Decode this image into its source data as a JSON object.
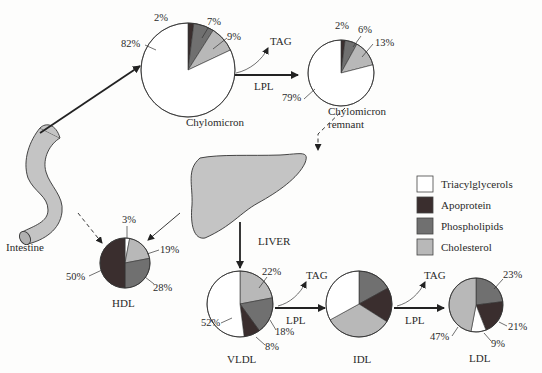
{
  "colors": {
    "triacylglycerols": "#ffffff",
    "apoprotein": "#3a2e2e",
    "phospholipids": "#707070",
    "cholesterol": "#b8b8b8",
    "organ_fill": "#c4c4c4",
    "outline": "#333333"
  },
  "legend": {
    "items": [
      {
        "key": "triacylglycerols",
        "label": "Triacylglycerols"
      },
      {
        "key": "apoprotein",
        "label": "Apoprotein"
      },
      {
        "key": "phospholipids",
        "label": "Phospholipids"
      },
      {
        "key": "cholesterol",
        "label": "Cholesterol"
      }
    ]
  },
  "organs": {
    "intestine": "Intestine",
    "liver": "LIVER"
  },
  "reactions": {
    "tag": "TAG",
    "lpl": "LPL"
  },
  "particles": {
    "chylomicron": {
      "label": "Chylomicron",
      "percents": {
        "triacylglycerols": "82%",
        "apoprotein": "2%",
        "phospholipids": "7%",
        "cholesterol": "9%"
      }
    },
    "chylomicron_remnant": {
      "label_line1": "Chylomicron",
      "label_line2": "remnant",
      "percents": {
        "triacylglycerols": "79%",
        "apoprotein": "2%",
        "phospholipids": "6%",
        "cholesterol": "13%"
      }
    },
    "hdl": {
      "label": "HDL",
      "percents": {
        "triacylglycerols": "3%",
        "cholesterol": "19%",
        "phospholipids": "28%",
        "apoprotein": "50%"
      }
    },
    "vldl": {
      "label": "VLDL",
      "percents": {
        "cholesterol": "22%",
        "phospholipids": "18%",
        "apoprotein": "8%",
        "triacylglycerols": "52%"
      }
    },
    "idl": {
      "label": "IDL"
    },
    "ldl": {
      "label": "LDL",
      "percents": {
        "phospholipids": "23%",
        "apoprotein": "21%",
        "triacylglycerols": "9%",
        "cholesterol": "47%"
      }
    }
  },
  "chart_data": {
    "type": "pie",
    "legend": [
      "Triacylglycerols",
      "Apoprotein",
      "Phospholipids",
      "Cholesterol"
    ],
    "pies": [
      {
        "name": "Chylomicron",
        "values": {
          "Triacylglycerols": 82,
          "Apoprotein": 2,
          "Phospholipids": 7,
          "Cholesterol": 9
        }
      },
      {
        "name": "Chylomicron remnant",
        "values": {
          "Triacylglycerols": 79,
          "Apoprotein": 2,
          "Phospholipids": 6,
          "Cholesterol": 13
        }
      },
      {
        "name": "HDL",
        "values": {
          "Triacylglycerols": 3,
          "Apoprotein": 50,
          "Phospholipids": 28,
          "Cholesterol": 19
        }
      },
      {
        "name": "VLDL",
        "values": {
          "Triacylglycerols": 52,
          "Apoprotein": 8,
          "Phospholipids": 18,
          "Cholesterol": 22
        }
      },
      {
        "name": "IDL",
        "values": {
          "Triacylglycerols": 33,
          "Apoprotein": 17,
          "Phospholipids": 17,
          "Cholesterol": 33
        },
        "note": "unlabeled; approximate"
      },
      {
        "name": "LDL",
        "values": {
          "Triacylglycerols": 9,
          "Apoprotein": 21,
          "Phospholipids": 23,
          "Cholesterol": 47
        }
      }
    ]
  }
}
